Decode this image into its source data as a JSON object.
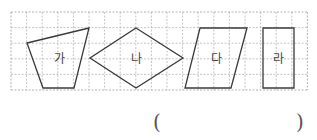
{
  "grid": {
    "origin_x": 11,
    "origin_y": 12,
    "cell": 15.6,
    "cols": 19,
    "rows": 5,
    "line_color": "#b5b5b5",
    "border_color": "#a0a0a0"
  },
  "shapes": [
    {
      "id": "ga",
      "label": "가",
      "type": "trapezoid",
      "points": "27,43 89,28 74,88 43,88",
      "label_x": 59,
      "label_y": 63
    },
    {
      "id": "na",
      "label": "나",
      "type": "rhombus",
      "points": "136,28 183,58 136,88 90,58",
      "label_x": 136,
      "label_y": 63
    },
    {
      "id": "da",
      "label": "다",
      "type": "parallelogram",
      "points": "200,28 247,28 231,88 185,88",
      "label_x": 216,
      "label_y": 63
    },
    {
      "id": "ra",
      "label": "라",
      "type": "rectangle",
      "points": "263,28 294,28 294,88 263,88",
      "label_x": 278,
      "label_y": 63
    }
  ],
  "shape_stroke": "#3a3a3a",
  "answer": {
    "open_paren": "(",
    "close_paren": ")",
    "value": ""
  }
}
